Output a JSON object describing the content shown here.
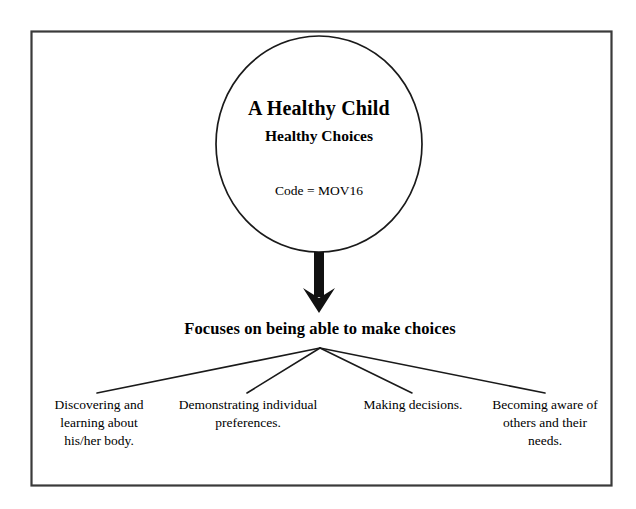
{
  "page": {
    "background_color": "#ffffff",
    "border_color": "#3a3a3a",
    "line_color": "#1a1a1a"
  },
  "diagram": {
    "type": "hierarchy-tree",
    "root_node": {
      "shape": "ellipse",
      "title": "A Healthy Child",
      "subtitle": "Healthy Choices",
      "code": "Code = MOV16"
    },
    "connector": {
      "kind": "down-arrow",
      "from": "root_node",
      "to": "branch_heading"
    },
    "branch_heading": "Focuses on being able to make choices",
    "leaves": [
      {
        "text": "Discovering and\nlearning about\nhis/her body."
      },
      {
        "text": "Demonstrating individual\npreferences."
      },
      {
        "text": "Making decisions."
      },
      {
        "text": "Becoming aware of\nothers and their\nneeds."
      }
    ]
  }
}
